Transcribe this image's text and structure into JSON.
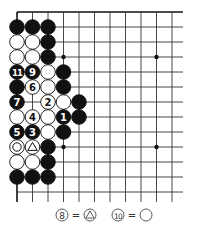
{
  "diagram": {
    "type": "go-board-diagram",
    "grid": {
      "columns": 11,
      "rows": 13,
      "origin_x": 17,
      "origin_y": 12,
      "col_spacing": 15.5,
      "row_spacing": 15,
      "line_extend_right": 183,
      "line_extend_bottom": 202,
      "top_edge": true,
      "left_edge": true,
      "line_color": "#333333",
      "edge_color": "#111111"
    },
    "hoshi": [
      {
        "col": 3,
        "row": 3
      },
      {
        "col": 9,
        "row": 3
      },
      {
        "col": 3,
        "row": 9
      },
      {
        "col": 9,
        "row": 9
      }
    ],
    "stones": [
      {
        "col": 0,
        "row": 1,
        "color": "black"
      },
      {
        "col": 1,
        "row": 1,
        "color": "black"
      },
      {
        "col": 2,
        "row": 1,
        "color": "black"
      },
      {
        "col": 0,
        "row": 2,
        "color": "white"
      },
      {
        "col": 1,
        "row": 2,
        "color": "white"
      },
      {
        "col": 2,
        "row": 2,
        "color": "black"
      },
      {
        "col": 0,
        "row": 3,
        "color": "white"
      },
      {
        "col": 1,
        "row": 3,
        "color": "white"
      },
      {
        "col": 2,
        "row": 3,
        "color": "black"
      },
      {
        "col": 0,
        "row": 4,
        "color": "black",
        "label": "11"
      },
      {
        "col": 1,
        "row": 4,
        "color": "black",
        "label": "9"
      },
      {
        "col": 2,
        "row": 4,
        "color": "white"
      },
      {
        "col": 3,
        "row": 4,
        "color": "black"
      },
      {
        "col": 0,
        "row": 5,
        "color": "black"
      },
      {
        "col": 1,
        "row": 5,
        "color": "white",
        "label": "6"
      },
      {
        "col": 2,
        "row": 5,
        "color": "white"
      },
      {
        "col": 3,
        "row": 5,
        "color": "black"
      },
      {
        "col": 0,
        "row": 6,
        "color": "black",
        "label": "7"
      },
      {
        "col": 2,
        "row": 6,
        "color": "white",
        "label": "2"
      },
      {
        "col": 3,
        "row": 6,
        "color": "white"
      },
      {
        "col": 4,
        "row": 6,
        "color": "black"
      },
      {
        "col": 0,
        "row": 7,
        "color": "white"
      },
      {
        "col": 1,
        "row": 7,
        "color": "white",
        "label": "4"
      },
      {
        "col": 2,
        "row": 7,
        "color": "white"
      },
      {
        "col": 3,
        "row": 7,
        "color": "black",
        "label": "1"
      },
      {
        "col": 4,
        "row": 7,
        "color": "black"
      },
      {
        "col": 0,
        "row": 8,
        "color": "black",
        "label": "5"
      },
      {
        "col": 1,
        "row": 8,
        "color": "black",
        "label": "3"
      },
      {
        "col": 2,
        "row": 8,
        "color": "white"
      },
      {
        "col": 3,
        "row": 8,
        "color": "black"
      },
      {
        "col": 0,
        "row": 9,
        "color": "white",
        "mark": "circle"
      },
      {
        "col": 1,
        "row": 9,
        "color": "white",
        "mark": "triangle"
      },
      {
        "col": 2,
        "row": 9,
        "color": "black"
      },
      {
        "col": 0,
        "row": 10,
        "color": "white"
      },
      {
        "col": 1,
        "row": 10,
        "color": "white"
      },
      {
        "col": 2,
        "row": 10,
        "color": "black"
      },
      {
        "col": 0,
        "row": 11,
        "color": "black"
      },
      {
        "col": 1,
        "row": 11,
        "color": "black"
      },
      {
        "col": 2,
        "row": 11,
        "color": "black"
      }
    ],
    "caption": [
      {
        "move": "8",
        "equals": "=",
        "mark": "triangle",
        "x": 62
      },
      {
        "move": "10",
        "equals": "=",
        "mark": "circle",
        "x": 118
      }
    ]
  }
}
